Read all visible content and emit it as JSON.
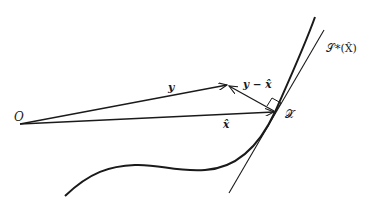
{
  "diagram": {
    "type": "geometric-projection",
    "labels": {
      "origin": "O",
      "vector_y": "y",
      "vector_residual": "y − x̂",
      "vector_xhat": "x̂",
      "point_xhat": "𝒳̂",
      "tangent_space": "𝒮*(X̂)"
    },
    "colors": {
      "stroke": "#1a1a1a",
      "background": "#ffffff"
    },
    "geometry": {
      "origin": [
        20,
        124
      ],
      "y_tip": [
        227,
        85
      ],
      "xhat_tip": [
        275,
        112
      ],
      "tangent_line": [
        [
          229,
          193
        ],
        [
          324,
          30
        ]
      ],
      "curve_start": [
        65,
        196
      ],
      "curve_end": [
        315,
        17
      ]
    }
  }
}
